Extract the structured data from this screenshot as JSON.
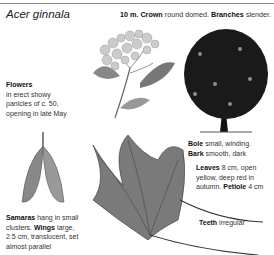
{
  "title": "Acer ginnala",
  "header": {
    "height_label": "10 m.",
    "crown_label": "Crown",
    "crown_text": "round domed.",
    "branches_label": "Branches",
    "branches_text": "slender."
  },
  "flowers": {
    "label": "Flowers",
    "line1": "in erect showy",
    "line2": "panicles of c. 50,",
    "line3": "opening in late May"
  },
  "samaras": {
    "label": "Samaras",
    "text1": "hang in small",
    "text2": "clusters.",
    "wings_label": "Wings",
    "wings_text": "large,",
    "line3": "2.5 cm, translucent, set",
    "line4": "almost parallel"
  },
  "bole": {
    "label": "Bole",
    "text": "small, winding."
  },
  "bark": {
    "label": "Bark",
    "text": "smooth, dark"
  },
  "leaves": {
    "label": "Leaves",
    "text1": "8 cm, open",
    "line2": "yellow, deep red in",
    "line3": "autumn.",
    "petiole_label": "Petiole",
    "petiole_text": "4 cm"
  },
  "teeth": {
    "label": "Teeth",
    "text": "irregular"
  },
  "illustrations": [
    "flower-panicle",
    "tree-silhouette",
    "samara",
    "leaf"
  ]
}
